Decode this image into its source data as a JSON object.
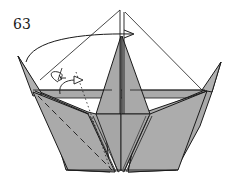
{
  "diagram": {
    "step_number": "63",
    "colors": {
      "paper": "#a9a9a9",
      "paper_light": "#b4b4b4",
      "line": "#1a1a1a",
      "background": "#ffffff"
    },
    "symbols": [
      "fold-over-arrow",
      "unfold-arrow",
      "valley-fold-dashed-line",
      "reference-line"
    ]
  }
}
